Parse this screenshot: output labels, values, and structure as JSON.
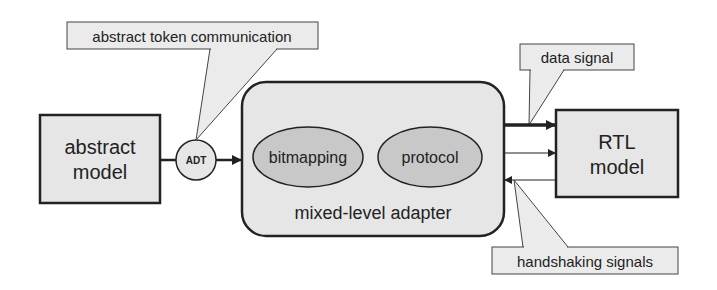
{
  "diagram": {
    "nodes": {
      "abstract_model": {
        "line1": "abstract",
        "line2": "model"
      },
      "adt": {
        "label": "ADT"
      },
      "adapter": {
        "label": "mixed-level adapter"
      },
      "bitmapping": {
        "label": "bitmapping"
      },
      "protocol": {
        "label": "protocol"
      },
      "rtl_model": {
        "line1": "RTL",
        "line2": "model"
      }
    },
    "callouts": {
      "abstract_token": {
        "label": "abstract token communication"
      },
      "data_signal": {
        "label": "data signal"
      },
      "handshaking": {
        "label": "handshaking signals"
      }
    },
    "colors": {
      "box_fill": "#e6e6e6",
      "ellipse_fill": "#c8c8c8",
      "stroke": "#222222",
      "callout_fill": "#ebebeb"
    }
  }
}
